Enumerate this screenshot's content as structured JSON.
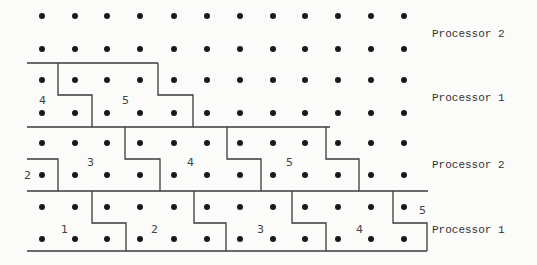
{
  "diagram": {
    "type": "processor-partition-grid",
    "dot_columns_x": [
      42,
      75,
      107,
      140,
      174,
      207,
      240,
      273,
      305,
      338,
      371,
      404
    ],
    "dot_rows_y": [
      16,
      49,
      80,
      113,
      143,
      175,
      207,
      239
    ],
    "bands": [
      {
        "label": "Processor 2",
        "label_x": 432,
        "label_y": 37,
        "rows": [
          0,
          1
        ]
      },
      {
        "label": "Processor 1",
        "label_x": 432,
        "label_y": 101,
        "rows": [
          2,
          3
        ]
      },
      {
        "label": "Processor 2",
        "label_x": 432,
        "label_y": 168,
        "rows": [
          4,
          5
        ]
      },
      {
        "label": "Processor 1",
        "label_x": 432,
        "label_y": 233,
        "rows": [
          6,
          7
        ]
      }
    ],
    "region_labels": [
      {
        "text": "4",
        "x": 39,
        "y": 104
      },
      {
        "text": "5",
        "x": 122,
        "y": 104
      },
      {
        "text": "2",
        "x": 24,
        "y": 179
      },
      {
        "text": "3",
        "x": 87,
        "y": 166
      },
      {
        "text": "4",
        "x": 187,
        "y": 166
      },
      {
        "text": "5",
        "x": 286,
        "y": 166
      },
      {
        "text": "1",
        "x": 61,
        "y": 233
      },
      {
        "text": "2",
        "x": 151,
        "y": 233
      },
      {
        "text": "3",
        "x": 257,
        "y": 233
      },
      {
        "text": "4",
        "x": 356,
        "y": 233
      },
      {
        "text": "5",
        "x": 419,
        "y": 214
      }
    ],
    "paths": [
      "M27 63 L158 63",
      "M58 63 L58 95 L92 95 L92 127",
      "M158 63 L158 95 L193 95 L193 127",
      "M27 127 L330 127",
      "M27 159 L58 159 L58 191",
      "M125 127 L125 159 L160 159 L160 191",
      "M227 127 L227 159 L261 159 L261 191",
      "M326 127 L326 159 L359 159 L359 191",
      "M27 191 L428 191",
      "M92 191 L92 223 L126 223 L126 251",
      "M194 191 L194 223 L226 223 L226 251",
      "M292 191 L292 223 L326 223 L326 251",
      "M393 191 L393 223 L427 223 L427 251",
      "M27 251 L427 251"
    ]
  }
}
